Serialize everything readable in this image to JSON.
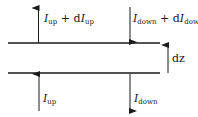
{
  "diagram": {
    "labels": {
      "top_left": {
        "var": "I",
        "sub": "up",
        "plus": " + d",
        "var2": "I",
        "sub2": "up"
      },
      "top_right": {
        "var": "I",
        "sub": "down",
        "plus": " + d",
        "var2": "I",
        "sub2": "down"
      },
      "bottom_left": {
        "var": "I",
        "sub": "up"
      },
      "bottom_right": {
        "var": "I",
        "sub": "down"
      },
      "thickness": "dz"
    },
    "colors": {
      "line": "#1a1a1a",
      "background": "#ffffff"
    }
  }
}
